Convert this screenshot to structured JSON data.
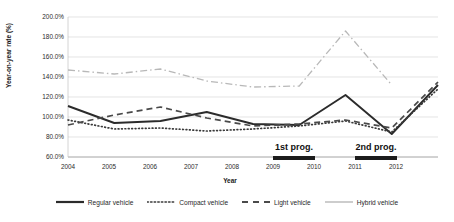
{
  "chart_data": {
    "type": "line",
    "title": "",
    "xlabel": "Year",
    "ylabel": "Year-on-year rate (%)",
    "x": [
      2004,
      2005,
      2006,
      2007,
      2008,
      2009,
      2010,
      2011,
      2012
    ],
    "xticklabels": [
      "2004",
      "2005",
      "2006",
      "2007",
      "2008",
      "2009",
      "2010",
      "2011",
      "2012"
    ],
    "yticklabels": [
      "60.0%",
      "80.0%",
      "100.0%",
      "120.0%",
      "140.0%",
      "160.0%",
      "180.0%",
      "200.0%"
    ],
    "ytickvalues": [
      60,
      80,
      100,
      120,
      140,
      160,
      180,
      200
    ],
    "ylim": [
      60,
      200
    ],
    "grid": true,
    "legend_position": "bottom",
    "series": [
      {
        "name": "Regular vehicle",
        "style": "solid",
        "color": "#2b2b2b",
        "values": [
          111,
          94,
          96,
          105,
          93,
          92,
          122,
          83,
          132
        ]
      },
      {
        "name": "Compact vehicle",
        "style": "dotted",
        "color": "#3a3a3a",
        "values": [
          97,
          88,
          89,
          86,
          88,
          91,
          96,
          85,
          128
        ]
      },
      {
        "name": "Light vehicle",
        "style": "dashed",
        "color": "#4a4a4a",
        "values": [
          92,
          102,
          110,
          99,
          91,
          93,
          97,
          89,
          135
        ]
      },
      {
        "name": "Hybrid vehicle",
        "style": "dashdot",
        "color": "#b8b8b8",
        "values": [
          147,
          143,
          148,
          136,
          130,
          131,
          186,
          132,
          null
        ]
      }
    ],
    "annotations": [
      {
        "label": "1st prog.",
        "start_year": 2009,
        "end_year": 2010
      },
      {
        "label": "2nd prog.",
        "start_year": 2011,
        "end_year": 2012
      }
    ]
  }
}
